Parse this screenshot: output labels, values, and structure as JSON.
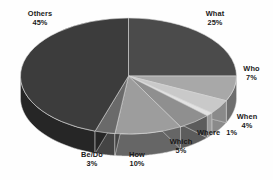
{
  "chart_data": {
    "type": "pie",
    "title": "",
    "subtitle": "",
    "xlabel": "",
    "ylabel": "",
    "legend_position": "none",
    "grid": false,
    "three_d": true,
    "value_unit": "%",
    "start_angle_deg": 0,
    "direction": "clockwise",
    "categories": [
      "What",
      "Who",
      "When",
      "Where",
      "Which",
      "How",
      "Be/Do",
      "Others"
    ],
    "values": [
      25,
      7,
      4,
      1,
      5,
      10,
      3,
      45
    ],
    "labels": [
      "What 25%",
      "Who 7%",
      "When 4%",
      "Where 1%",
      "Which 5%",
      "How 10%",
      "Be/Do 3%",
      "Others 45%"
    ],
    "slices": [
      {
        "name": "What",
        "value": 25,
        "percent_text": "25%",
        "color": "#4b4b4b",
        "side_color": "#2f2f2f"
      },
      {
        "name": "Who",
        "value": 7,
        "percent_text": "7%",
        "color": "#a8a8a8",
        "side_color": "#6e6e6e"
      },
      {
        "name": "When",
        "value": 4,
        "percent_text": "4%",
        "color": "#c9c9c9",
        "side_color": "#8a8a8a"
      },
      {
        "name": "Where",
        "value": 1,
        "percent_text": "1%",
        "color": "#e2e2e2",
        "side_color": "#9a9a9a"
      },
      {
        "name": "Which",
        "value": 5,
        "percent_text": "5%",
        "color": "#8f8f8f",
        "side_color": "#5c5c5c"
      },
      {
        "name": "How",
        "value": 10,
        "percent_text": "10%",
        "color": "#9d9d9d",
        "side_color": "#666666"
      },
      {
        "name": "Be/Do",
        "value": 3,
        "percent_text": "3%",
        "color": "#6a6a6a",
        "side_color": "#444444"
      },
      {
        "name": "Others",
        "value": 45,
        "percent_text": "45%",
        "color": "#3c3c3c",
        "side_color": "#262626"
      }
    ]
  },
  "labels": {
    "others": {
      "name": "Others",
      "pct": "45%"
    },
    "what": {
      "name": "What",
      "pct": "25%"
    },
    "who": {
      "name": "Who",
      "pct": "7%"
    },
    "when": {
      "name": "When",
      "pct": "4%"
    },
    "where": {
      "name": "Where",
      "pct": "1%"
    },
    "which": {
      "name": "Which",
      "pct": "5%"
    },
    "how": {
      "name": "How",
      "pct": "10%"
    },
    "bedo": {
      "name": "Be/Do",
      "pct": "3%"
    }
  },
  "style": {
    "background": "#fefefe",
    "label_color": "#1a1a1a",
    "edge_color": "#d8d8d8"
  }
}
